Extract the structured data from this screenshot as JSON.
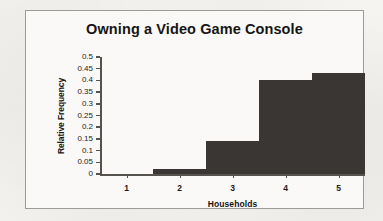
{
  "chart_data": {
    "type": "bar",
    "title": "Owning a Video Game Console",
    "xlabel": "Households",
    "ylabel": "Relative Frequency",
    "categories": [
      "1",
      "2",
      "3",
      "4",
      "5"
    ],
    "values": [
      0.0,
      0.02,
      0.14,
      0.4,
      0.43
    ],
    "ylim": [
      0,
      0.5
    ],
    "ytick_labels": [
      "0.5",
      "0.45",
      "0.4",
      "0.35",
      "0.3",
      "0.25",
      "0.2",
      "0.15",
      "0.1",
      "0.05",
      "0"
    ],
    "ytick_values": [
      0.5,
      0.45,
      0.4,
      0.35,
      0.3,
      0.25,
      0.2,
      0.15,
      0.1,
      0.05,
      0
    ],
    "grid": false,
    "legend": null,
    "bar_color": "#3a3633",
    "axis_color": "#56534f",
    "plot_background": "#faf9f7",
    "border_color": "#9b9b98"
  }
}
